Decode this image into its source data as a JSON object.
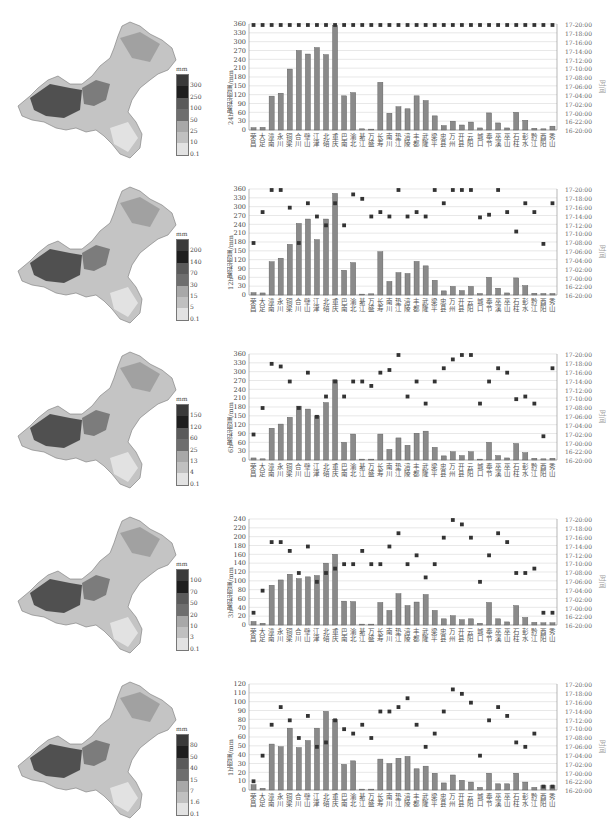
{
  "stations": [
    "荣昌",
    "大足",
    "潼南",
    "永川",
    "铜梁",
    "合川",
    "璧山",
    "江津",
    "北碚",
    "重庆",
    "巴南",
    "渝北",
    "綦江",
    "万盛",
    "长寿",
    "南川",
    "垫江",
    "涪陵",
    "丰都",
    "武隆",
    "梁平",
    "忠县",
    "万州",
    "开县",
    "云阳",
    "城口",
    "奉节",
    "巫溪",
    "巫山",
    "石柱",
    "彭水",
    "黔江",
    "酉阳",
    "秀山"
  ],
  "time_ticks": [
    "16-20:00",
    "16-22:00",
    "17-00:00",
    "17-02:00",
    "17-04:00",
    "17-06:00",
    "17-08:00",
    "17-10:00",
    "17-12:00",
    "17-14:00",
    "17-16:00",
    "17-18:00",
    "17-20:00"
  ],
  "time_axis_label": "时间",
  "colors": {
    "bar": "#8a8a8a",
    "bar_edge": "#555555",
    "marker": "#333333",
    "grid": "#d8d8d8",
    "axis": "#888888"
  },
  "panels": [
    {
      "id": "24h",
      "ylabel": "24h累积雨量/mm",
      "legend": {
        "unit": "mm",
        "labels": [
          "300",
          "250",
          "100",
          "50",
          "25",
          "10",
          "0.1"
        ],
        "colors": [
          "#3a3a3a",
          "#1e1e1e",
          "#5a5a5a",
          "#6e6e6e",
          "#a8a8a8",
          "#c0c0c0",
          "#e2e2e2"
        ]
      },
      "yticks": [
        "0",
        "30",
        "60",
        "90",
        "120",
        "150",
        "180",
        "210",
        "240",
        "270",
        "300",
        "330",
        "360"
      ]
    },
    {
      "id": "12h",
      "ylabel": "12h累积雨量/mm",
      "legend": {
        "unit": "mm",
        "labels": [
          "200",
          "140",
          "70",
          "30",
          "15",
          "5",
          "0.1"
        ],
        "colors": [
          "#3a3a3a",
          "#1e1e1e",
          "#5a5a5a",
          "#6e6e6e",
          "#a8a8a8",
          "#c0c0c0",
          "#e2e2e2"
        ]
      },
      "yticks": [
        "0",
        "30",
        "60",
        "90",
        "120",
        "150",
        "180",
        "210",
        "240",
        "270",
        "300",
        "330",
        "360"
      ]
    },
    {
      "id": "6h",
      "ylabel": "6h累积雨量/mm",
      "legend": {
        "unit": "mm",
        "labels": [
          "150",
          "120",
          "60",
          "25",
          "13",
          "4",
          "0.1"
        ],
        "colors": [
          "#3a3a3a",
          "#1e1e1e",
          "#5a5a5a",
          "#6e6e6e",
          "#a8a8a8",
          "#c0c0c0",
          "#e2e2e2"
        ]
      },
      "yticks": [
        "0",
        "30",
        "60",
        "90",
        "120",
        "150",
        "180",
        "210",
        "240",
        "270",
        "300",
        "330",
        "360"
      ]
    },
    {
      "id": "3h",
      "ylabel": "3h累积雨量/mm",
      "legend": {
        "unit": "mm",
        "labels": [
          "100",
          "70",
          "50",
          "20",
          "10",
          "3",
          "0.1"
        ],
        "colors": [
          "#3a3a3a",
          "#1e1e1e",
          "#5a5a5a",
          "#6e6e6e",
          "#a8a8a8",
          "#c0c0c0",
          "#e2e2e2"
        ]
      },
      "yticks": [
        "0",
        "20",
        "40",
        "60",
        "80",
        "100",
        "120",
        "140",
        "160",
        "180",
        "200",
        "220",
        "240"
      ]
    },
    {
      "id": "1h",
      "ylabel": "1h雨量/mm",
      "legend": {
        "unit": "mm",
        "labels": [
          "80",
          "50",
          "40",
          "15",
          "7",
          "1.6",
          "0.1"
        ],
        "colors": [
          "#3a3a3a",
          "#1e1e1e",
          "#5a5a5a",
          "#6e6e6e",
          "#a8a8a8",
          "#c0c0c0",
          "#e2e2e2"
        ]
      },
      "yticks": [
        "0",
        "10",
        "20",
        "30",
        "40",
        "50",
        "60",
        "70",
        "80",
        "90",
        "100",
        "110",
        "120"
      ]
    }
  ],
  "chart_data": [
    {
      "type": "bar",
      "title": "24h累积雨量",
      "ylabel": "24h累积雨量/mm",
      "y2label": "时间",
      "ylim": [
        0,
        360
      ],
      "categories": [
        "荣昌",
        "大足",
        "潼南",
        "永川",
        "铜梁",
        "合川",
        "璧山",
        "江津",
        "北碚",
        "重庆",
        "巴南",
        "渝北",
        "綦江",
        "万盛",
        "长寿",
        "南川",
        "垫江",
        "涪陵",
        "丰都",
        "武隆",
        "梁平",
        "忠县",
        "万州",
        "开县",
        "云阳",
        "城口",
        "奉节",
        "巫溪",
        "巫山",
        "石柱",
        "彭水",
        "黔江",
        "酉阳",
        "秀山"
      ],
      "series": [
        {
          "name": "累积雨量",
          "type": "bar",
          "values": [
            8,
            9,
            115,
            125,
            207,
            270,
            258,
            280,
            256,
            355,
            116,
            127,
            4,
            3,
            162,
            57,
            79,
            72,
            116,
            100,
            48,
            15,
            30,
            17,
            27,
            7,
            58,
            24,
            7,
            60,
            33,
            6,
            4,
            13
          ]
        },
        {
          "name": "时间",
          "type": "scatter",
          "axis": "y2",
          "values_hours_from_16_20": [
            24,
            24,
            24,
            24,
            24,
            24,
            24,
            24,
            24,
            24,
            24,
            24,
            24,
            24,
            24,
            24,
            24,
            24,
            24,
            24,
            24,
            24,
            24,
            24,
            24,
            24,
            24,
            24,
            24,
            24,
            24,
            24,
            24,
            24
          ]
        }
      ]
    },
    {
      "type": "bar",
      "title": "12h累积雨量",
      "ylabel": "12h累积雨量/mm",
      "y2label": "时间",
      "ylim": [
        0,
        360
      ],
      "categories": [
        "荣昌",
        "大足",
        "潼南",
        "永川",
        "铜梁",
        "合川",
        "璧山",
        "江津",
        "北碚",
        "重庆",
        "巴南",
        "渝北",
        "綦江",
        "万盛",
        "长寿",
        "南川",
        "垫江",
        "涪陵",
        "丰都",
        "武隆",
        "梁平",
        "忠县",
        "万州",
        "开县",
        "云阳",
        "城口",
        "奉节",
        "巫溪",
        "巫山",
        "石柱",
        "彭水",
        "黔江",
        "酉阳",
        "秀山"
      ],
      "series": [
        {
          "name": "累积雨量",
          "type": "bar",
          "values": [
            8,
            7,
            113,
            125,
            172,
            243,
            258,
            188,
            258,
            345,
            84,
            110,
            3,
            4,
            147,
            46,
            76,
            73,
            114,
            99,
            50,
            14,
            29,
            15,
            29,
            5,
            60,
            23,
            7,
            58,
            32,
            6,
            5,
            5
          ]
        },
        {
          "name": "时间",
          "type": "scatter",
          "axis": "y2",
          "values_hours_from_16_20": [
            12,
            19,
            24,
            24,
            20,
            12,
            21,
            18,
            16,
            21,
            16,
            23,
            22,
            18,
            19,
            18,
            24,
            18,
            19,
            18,
            24,
            21,
            24,
            24,
            24,
            17.8,
            18.4,
            24,
            19,
            14.6,
            21,
            19,
            11.8,
            21
          ]
        }
      ]
    },
    {
      "type": "bar",
      "title": "6h累积雨量",
      "ylabel": "6h累积雨量/mm",
      "y2label": "时间",
      "ylim": [
        0,
        360
      ],
      "categories": [
        "荣昌",
        "大足",
        "潼南",
        "永川",
        "铜梁",
        "合川",
        "璧山",
        "江津",
        "北碚",
        "重庆",
        "巴南",
        "渝北",
        "綦江",
        "万盛",
        "长寿",
        "南川",
        "垫江",
        "涪陵",
        "丰都",
        "武隆",
        "梁平",
        "忠县",
        "万州",
        "开县",
        "云阳",
        "城口",
        "奉节",
        "巫溪",
        "巫山",
        "石柱",
        "彭水",
        "黔江",
        "酉阳",
        "秀山"
      ],
      "series": [
        {
          "name": "累积雨量",
          "type": "bar",
          "values": [
            7,
            4,
            108,
            122,
            145,
            183,
            173,
            150,
            195,
            272,
            60,
            88,
            3,
            3,
            88,
            36,
            75,
            50,
            91,
            98,
            43,
            14,
            28,
            15,
            28,
            3,
            60,
            15,
            7,
            56,
            25,
            6,
            4,
            6
          ]
        },
        {
          "name": "时间",
          "type": "scatter",
          "axis": "y2",
          "values_hours_from_16_20": [
            6,
            12,
            22,
            21.4,
            18,
            12,
            20,
            10,
            14.6,
            18,
            14.6,
            18,
            18,
            17,
            20,
            20.6,
            24,
            14.6,
            18,
            13,
            18,
            21,
            23,
            24,
            24,
            13,
            18,
            21,
            20,
            14,
            14.6,
            13,
            5.6,
            21
          ]
        }
      ]
    },
    {
      "type": "bar",
      "title": "3h累积雨量",
      "ylabel": "3h累积雨量/mm",
      "y2label": "时间",
      "ylim": [
        0,
        240
      ],
      "categories": [
        "荣昌",
        "大足",
        "潼南",
        "永川",
        "铜梁",
        "合川",
        "璧山",
        "江津",
        "北碚",
        "重庆",
        "巴南",
        "渝北",
        "綦江",
        "万盛",
        "长寿",
        "南川",
        "垫江",
        "涪陵",
        "丰都",
        "武隆",
        "梁平",
        "忠县",
        "万州",
        "开县",
        "云阳",
        "城口",
        "奉节",
        "巫溪",
        "巫山",
        "石柱",
        "彭水",
        "黔江",
        "酉阳",
        "秀山"
      ],
      "series": [
        {
          "name": "累积雨量",
          "type": "bar",
          "values": [
            8,
            4,
            90,
            102,
            115,
            105,
            109,
            112,
            140,
            160,
            54,
            53,
            2,
            2,
            51,
            33,
            71,
            44,
            52,
            69,
            33,
            14,
            21,
            12,
            14,
            4,
            51,
            14,
            7,
            44,
            17,
            6,
            5,
            5
          ]
        },
        {
          "name": "时间",
          "type": "scatter",
          "axis": "y2",
          "values_hours_from_16_20": [
            3,
            8,
            19,
            19,
            17,
            12,
            18,
            10,
            12,
            13,
            14,
            14,
            17,
            14,
            14,
            18,
            21,
            14,
            16,
            11,
            14,
            20,
            24,
            23,
            20,
            10,
            16,
            21,
            19,
            12,
            12,
            13,
            3,
            3
          ]
        }
      ]
    },
    {
      "type": "bar",
      "title": "1h雨量",
      "ylabel": "1h雨量/mm",
      "y2label": "时间",
      "ylim": [
        0,
        120
      ],
      "categories": [
        "荣昌",
        "大足",
        "潼南",
        "永川",
        "铜梁",
        "合川",
        "璧山",
        "江津",
        "北碚",
        "重庆",
        "巴南",
        "渝北",
        "綦江",
        "万盛",
        "长寿",
        "南川",
        "垫江",
        "涪陵",
        "丰都",
        "武隆",
        "梁平",
        "忠县",
        "万州",
        "开县",
        "云阳",
        "城口",
        "奉节",
        "巫溪",
        "巫山",
        "石柱",
        "彭水",
        "黔江",
        "酉阳",
        "秀山"
      ],
      "series": [
        {
          "name": "雨量",
          "type": "bar",
          "values": [
            6,
            2,
            52,
            49,
            70,
            48,
            56,
            70,
            89,
            80,
            29,
            33,
            1,
            1,
            35,
            30,
            36,
            38,
            24,
            27,
            19,
            8,
            17,
            11,
            9,
            3,
            19,
            7,
            7,
            19,
            9,
            3,
            5,
            5
          ]
        },
        {
          "name": "时间",
          "type": "scatter",
          "axis": "y2",
          "values_hours_from_16_20": [
            2.2,
            8,
            15,
            19,
            16,
            12,
            17,
            10,
            11,
            16,
            14,
            13,
            15,
            12,
            18,
            18,
            19,
            21,
            15,
            10,
            13,
            18,
            23,
            22,
            20,
            8,
            16,
            19,
            17,
            11,
            10,
            13,
            1,
            1
          ]
        }
      ]
    }
  ]
}
